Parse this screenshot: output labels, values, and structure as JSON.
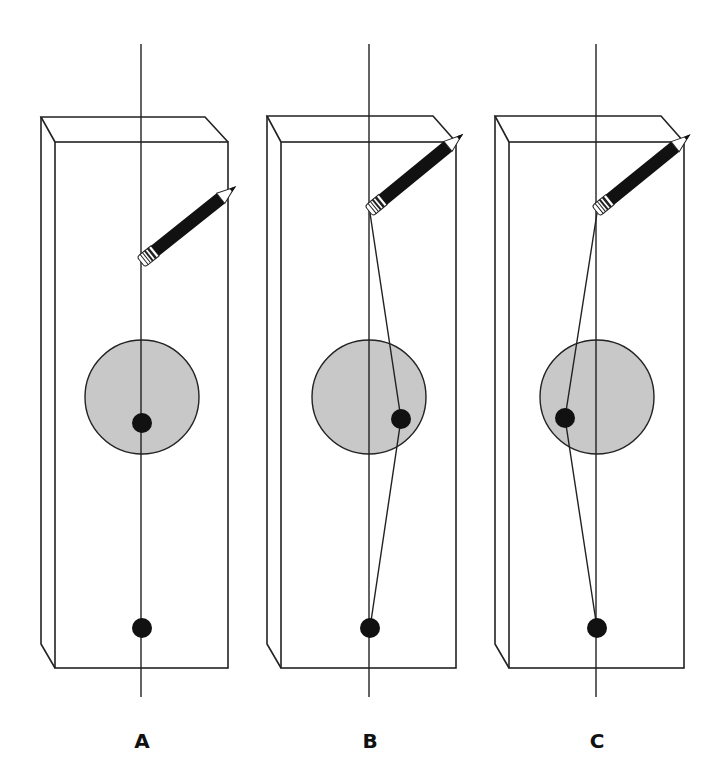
{
  "diagram": {
    "colors": {
      "stroke": "#222222",
      "circle_fill": "#c8c8c8",
      "dot": "#111111",
      "pencil_body": "#111111",
      "background": "#ffffff"
    },
    "panels": [
      {
        "label": "A",
        "line_x": 141,
        "pencil": {
          "eraser": [
            141,
            262
          ],
          "tip": [
            237,
            186
          ]
        },
        "circle": {
          "cx": 142,
          "cy": 397,
          "r": 57
        },
        "upper_dot": [
          142,
          423
        ],
        "lower_dot": [
          142,
          628
        ],
        "path": "straight"
      },
      {
        "label": "B",
        "line_x": 369,
        "pencil": {
          "eraser": [
            369,
            211
          ],
          "tip": [
            464,
            133
          ]
        },
        "circle": {
          "cx": 369,
          "cy": 397,
          "r": 57
        },
        "upper_dot": [
          401,
          419
        ],
        "lower_dot": [
          370,
          628
        ],
        "path": "bent-right"
      },
      {
        "label": "C",
        "line_x": 596,
        "pencil": {
          "eraser": [
            596,
            211
          ],
          "tip": [
            692,
            133
          ]
        },
        "circle": {
          "cx": 597,
          "cy": 397,
          "r": 57
        },
        "upper_dot": [
          565,
          418
        ],
        "lower_dot": [
          597,
          628
        ],
        "path": "bent-left"
      }
    ]
  }
}
